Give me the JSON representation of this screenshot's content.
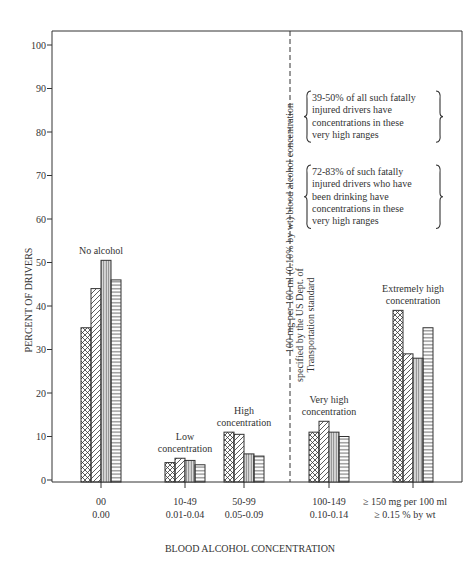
{
  "chart_data": {
    "type": "bar",
    "title": "",
    "xlabel": "BLOOD ALCOHOL CONCENTRATION",
    "ylabel": "PERCENT OF DRIVERS",
    "ylim": [
      0,
      100
    ],
    "yticks": [
      0,
      10,
      20,
      30,
      40,
      50,
      60,
      70,
      80,
      90,
      100
    ],
    "grid": false,
    "categories": [
      {
        "line1": "00",
        "line2": "0.00",
        "group_label": [
          "No alcohol"
        ]
      },
      {
        "line1": "10-49",
        "line2": "0.01-0.04",
        "group_label": [
          "Low",
          "concentration"
        ]
      },
      {
        "line1": "50-99",
        "line2": "0.05-0.09",
        "group_label": [
          "High",
          "concentration"
        ]
      },
      {
        "line1": "100-149",
        "line2": "0.10-0.14",
        "group_label": [
          "Very high",
          "concentration"
        ]
      },
      {
        "line1": "≥ 150 mg per 100 ml",
        "line2": "≥ 0.15 % by wt",
        "group_label": [
          "Extremely high",
          "concentration"
        ]
      }
    ],
    "series": [
      {
        "name": "series-1",
        "pattern": "crosshatch",
        "values": [
          35,
          4,
          11,
          11,
          39
        ]
      },
      {
        "name": "series-2",
        "pattern": "diagonal",
        "values": [
          44,
          5,
          10.5,
          13.5,
          29
        ]
      },
      {
        "name": "series-3",
        "pattern": "vertical",
        "values": [
          50.5,
          4.5,
          6,
          11,
          28
        ]
      },
      {
        "name": "series-4",
        "pattern": "horizontal",
        "values": [
          46,
          3.5,
          5.5,
          10,
          35
        ]
      }
    ],
    "reference_line": {
      "value_between": "50-99 and 100-149",
      "label": [
        "100 mg per 100 ml (0.10% by wt) blood alcohol concentration",
        "specified by the US Dept. of",
        "Transportation standard"
      ]
    },
    "annotations": [
      [
        "39-50% of all such fatally",
        "injured drivers have",
        "concentrations in these",
        "very high ranges"
      ],
      [
        "72-83% of such fatally",
        "injured drivers who have",
        "been drinking have",
        "concentrations in these",
        "very high ranges"
      ]
    ]
  }
}
